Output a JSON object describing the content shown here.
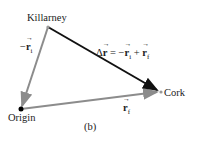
{
  "figure_label": "(b)",
  "points": {
    "killarney": {
      "label": "Killarney",
      "x": 48,
      "y": 27
    },
    "cork": {
      "label": "Cork",
      "x": 160,
      "y": 92
    },
    "origin": {
      "label": "Origin",
      "x": 21,
      "y": 109
    }
  },
  "vectors": {
    "neg_ri": {
      "prefix": "−",
      "symbol": "r",
      "sub": "i",
      "from": "killarney",
      "to": "origin",
      "color": "#8c8c8c"
    },
    "rf": {
      "symbol": "r",
      "sub": "f",
      "from": "origin",
      "to": "cork",
      "color": "#8c8c8c"
    },
    "delta_r": {
      "lhs": "Δ",
      "symbol": "r",
      "eq": " = −",
      "t1": "r",
      "s1": "i",
      "plus": " + ",
      "t2": "r",
      "s2": "f",
      "from": "killarney",
      "to": "cork",
      "color": "#111111"
    }
  }
}
